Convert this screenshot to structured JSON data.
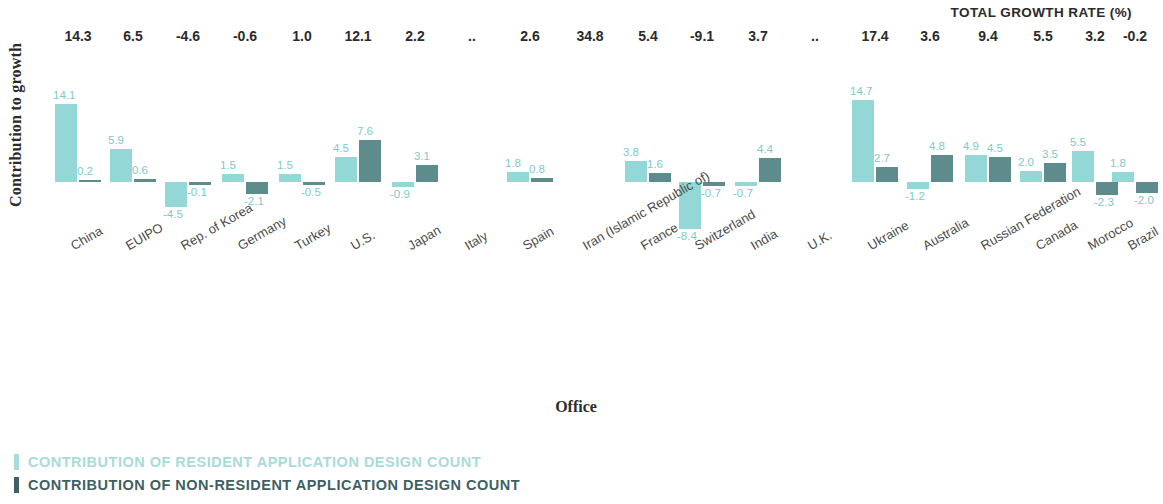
{
  "header": {
    "total_growth_rate_label": "TOTAL GROWTH RATE (%)"
  },
  "axes": {
    "y_title": "Contribution to growth",
    "x_title": "Office"
  },
  "legend": [
    {
      "key": "resident",
      "label": "CONTRIBUTION OF RESIDENT APPLICATION DESIGN COUNT",
      "color": "#a8dbd9"
    },
    {
      "key": "nonresident",
      "label": "CONTRIBUTION OF NON-RESIDENT APPLICATION DESIGN COUNT",
      "color": "#3f5f63"
    }
  ],
  "colors": {
    "resident_bar": "#93d8d6",
    "nonresident_bar": "#5e8c8c",
    "value_label": "#7ec9c8",
    "growth_label": "#2b2b2b"
  },
  "chart_data": {
    "type": "bar",
    "title": "",
    "xlabel": "Office",
    "ylabel": "Contribution to growth",
    "grid": false,
    "legend_position": "bottom-left",
    "ylim": [
      -9.5,
      15.5
    ],
    "categories": [
      "China",
      "EUIPO",
      "Rep. of Korea",
      "Germany",
      "Turkey",
      "U.S.",
      "Japan",
      "Italy",
      "Spain",
      "Iran (Islamic Republic of)",
      "France",
      "Switzerland",
      "India",
      "U.K.",
      "Ukraine",
      "Australia",
      "Russian Federation",
      "Canada",
      "Morocco",
      "Brazil"
    ],
    "series": [
      {
        "name": "CONTRIBUTION OF RESIDENT APPLICATION DESIGN COUNT",
        "color": "#93d8d6",
        "values": [
          14.1,
          5.9,
          -4.5,
          1.5,
          1.5,
          4.5,
          -0.9,
          null,
          1.8,
          null,
          3.8,
          -8.4,
          -0.7,
          null,
          14.7,
          -1.2,
          4.9,
          2.0,
          5.5,
          1.8
        ],
        "labels": [
          "14.1",
          "5.9",
          "-4.5",
          "1.5",
          "1.5",
          "4.5",
          "-0.9",
          "",
          "1.8",
          "",
          "3.8",
          "-8.4",
          "-0.7",
          "",
          "14.7",
          "-1.2",
          "4.9",
          "2.0",
          "5.5",
          "1.8"
        ]
      },
      {
        "name": "CONTRIBUTION OF NON-RESIDENT APPLICATION DESIGN COUNT",
        "color": "#5e8c8c",
        "values": [
          0.2,
          0.6,
          -0.1,
          -2.1,
          -0.5,
          7.6,
          3.1,
          null,
          0.8,
          null,
          1.6,
          -0.7,
          4.4,
          null,
          2.7,
          4.8,
          4.5,
          3.5,
          -2.3,
          -2.0
        ],
        "labels": [
          "0.2",
          "0.6",
          "-0.1",
          "-2.1",
          "-0.5",
          "7.6",
          "3.1",
          "",
          "0.8",
          "",
          "1.6",
          "-0.7",
          "4.4",
          "",
          "2.7",
          "4.8",
          "4.5",
          "3.5",
          "-2.3",
          "-2.0"
        ]
      }
    ],
    "total_growth_rate": [
      "14.3",
      "6.5",
      "-4.6",
      "-0.6",
      "1.0",
      "12.1",
      "2.2",
      "..",
      "2.6",
      "34.8",
      "5.4",
      "-9.1",
      "3.7",
      "..",
      "17.4",
      "3.6",
      "9.4",
      "5.5",
      "3.2",
      "-0.2"
    ]
  }
}
